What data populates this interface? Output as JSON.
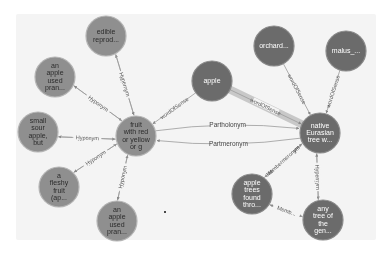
{
  "graph": {
    "colors": {
      "light_node": "#8f8f8f",
      "light_node_stroke": "#b5b5b5",
      "light_text": "#2b2b2b",
      "dark_node": "#6b6b6b",
      "dark_node_stroke": "#8a8a8a",
      "dark_text": "#ffffff",
      "edge": "#9a9a9a",
      "highlight_edge": "#c8c8c8"
    },
    "nodes": [
      {
        "id": "fruit",
        "lines": [
          "fruit",
          "with red",
          "or yellow",
          "or g"
        ],
        "x": 136,
        "y": 136,
        "r": 20,
        "style": "light"
      },
      {
        "id": "edible",
        "lines": [
          "edible",
          "reprod..."
        ],
        "x": 106,
        "y": 36,
        "r": 20,
        "style": "light"
      },
      {
        "id": "apple_used_top",
        "lines": [
          "an",
          "apple",
          "used",
          "pran..."
        ],
        "x": 55,
        "y": 77,
        "r": 20,
        "style": "light"
      },
      {
        "id": "small_sour",
        "lines": [
          "small",
          "sour",
          "apple,",
          "but"
        ],
        "x": 38,
        "y": 132,
        "r": 20,
        "style": "light"
      },
      {
        "id": "fleshy",
        "lines": [
          "a",
          "fleshy",
          "fruit",
          "(ap..."
        ],
        "x": 59,
        "y": 187,
        "r": 20,
        "style": "light"
      },
      {
        "id": "apple_used_bottom",
        "lines": [
          "an",
          "apple",
          "used",
          "pran..."
        ],
        "x": 117,
        "y": 221,
        "r": 20,
        "style": "light"
      },
      {
        "id": "apple",
        "lines": [
          "apple"
        ],
        "x": 212,
        "y": 81,
        "r": 20,
        "style": "dark"
      },
      {
        "id": "orchard",
        "lines": [
          "orchard..."
        ],
        "x": 274,
        "y": 46,
        "r": 20,
        "style": "dark"
      },
      {
        "id": "malus",
        "lines": [
          "malus_..."
        ],
        "x": 346,
        "y": 51,
        "r": 20,
        "style": "dark"
      },
      {
        "id": "native",
        "lines": [
          "native",
          "Eurasian",
          "tree w..."
        ],
        "x": 320,
        "y": 133,
        "r": 20,
        "style": "dark"
      },
      {
        "id": "apple_trees",
        "lines": [
          "apple",
          "trees",
          "found",
          "thro..."
        ],
        "x": 252,
        "y": 194,
        "r": 20,
        "style": "dark"
      },
      {
        "id": "any_tree",
        "lines": [
          "any",
          "tree of",
          "the",
          "gen..."
        ],
        "x": 323,
        "y": 220,
        "r": 20,
        "style": "dark"
      }
    ],
    "edges": [
      {
        "from": "fruit",
        "to": "edible",
        "label": "Hyponym",
        "offset": -4
      },
      {
        "from": "edible",
        "to": "fruit",
        "label": "Hypernym",
        "offset": -4
      },
      {
        "from": "apple_used_top",
        "to": "fruit",
        "label": "Hypernym",
        "offset": -4
      },
      {
        "from": "fruit",
        "to": "apple_used_top",
        "label": "Hyponym",
        "offset": -4
      },
      {
        "from": "small_sour",
        "to": "fruit",
        "label": "Hypernym",
        "offset": -4
      },
      {
        "from": "fruit",
        "to": "small_sour",
        "label": "Hyponym",
        "offset": -4
      },
      {
        "from": "fleshy",
        "to": "fruit",
        "label": "Hypernym",
        "offset": -4
      },
      {
        "from": "fruit",
        "to": "fleshy",
        "label": "Hyponym",
        "offset": -4
      },
      {
        "from": "apple_used_bottom",
        "to": "fruit",
        "label": "Hypernym",
        "offset": -4
      },
      {
        "from": "fruit",
        "to": "apple_used_bottom",
        "label": "Hyponym",
        "offset": -4
      },
      {
        "from": "apple",
        "to": "fruit",
        "label": "wordOfSense",
        "offset": 0
      },
      {
        "from": "apple",
        "to": "native",
        "label": "wordOfSense",
        "offset": 0,
        "highlight": true
      },
      {
        "from": "orchard",
        "to": "native",
        "label": "wordOfSense",
        "offset": 0
      },
      {
        "from": "malus",
        "to": "native",
        "label": "wordOfSense",
        "offset": 0
      },
      {
        "from": "native",
        "to": "apple_trees",
        "label": "Memberholonym",
        "offset": -4
      },
      {
        "from": "apple_trees",
        "to": "native",
        "label": "Membermeronym",
        "offset": -4
      },
      {
        "from": "native",
        "to": "any_tree",
        "label": "Hyponym",
        "offset": -4
      },
      {
        "from": "any_tree",
        "to": "native",
        "label": "Hypernym",
        "offset": -4
      },
      {
        "from": "apple_trees",
        "to": "any_tree",
        "label": "Memb...",
        "offset": -4
      },
      {
        "from": "any_tree",
        "to": "apple_trees",
        "label": "Memb...",
        "offset": -4
      }
    ],
    "curved_edges": [
      {
        "from": "fruit",
        "to": "native",
        "label": "Partholonym",
        "bend": -14
      },
      {
        "from": "native",
        "to": "fruit",
        "label": "Partmeronym",
        "bend": -14
      }
    ]
  }
}
